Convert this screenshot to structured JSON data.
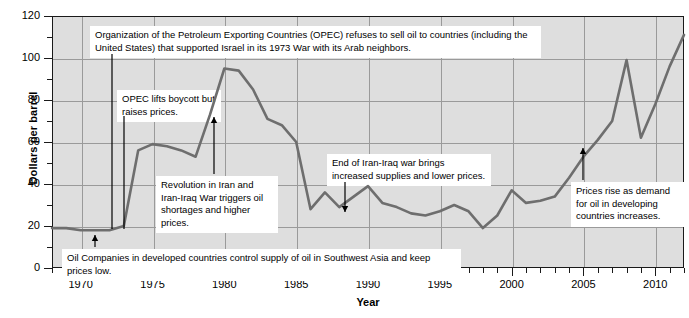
{
  "chart_data": {
    "type": "line",
    "title": "",
    "xlabel": "Year",
    "ylabel": "Dollars per barrel",
    "xlim": [
      1968,
      2012
    ],
    "ylim": [
      0,
      120
    ],
    "ytick_values": [
      0,
      20,
      40,
      60,
      80,
      100,
      120
    ],
    "ytick_labels": [
      "0",
      "20",
      "40",
      "60",
      "80",
      "100",
      "120"
    ],
    "xtick_values": [
      1970,
      1975,
      1980,
      1985,
      1990,
      1995,
      2000,
      2005,
      2010
    ],
    "xtick_labels": [
      "1970",
      "1975",
      "1980",
      "1985",
      "1990",
      "1995",
      "2000",
      "2005",
      "2010"
    ],
    "y_minor_step": 10,
    "x_minor_step": 1,
    "grid": true,
    "legend": "none",
    "series_name": "Crude oil price",
    "line_color": "#6e6e6e",
    "plot_background": "#dedede",
    "x": [
      1968,
      1969,
      1970,
      1971,
      1972,
      1973,
      1974,
      1975,
      1976,
      1977,
      1978,
      1979,
      1980,
      1981,
      1982,
      1983,
      1984,
      1985,
      1986,
      1987,
      1988,
      1989,
      1990,
      1991,
      1992,
      1993,
      1994,
      1995,
      1996,
      1997,
      1998,
      1999,
      2000,
      2001,
      2002,
      2003,
      2004,
      2005,
      2006,
      2007,
      2008,
      2009,
      2010,
      2011,
      2012
    ],
    "values": [
      19,
      19,
      18,
      18,
      18,
      20,
      56,
      59,
      58,
      56,
      53,
      73,
      95,
      94,
      85,
      71,
      68,
      60,
      28,
      36,
      29,
      34,
      39,
      31,
      29,
      26,
      25,
      27,
      30,
      27,
      19,
      25,
      37,
      31,
      32,
      34,
      43,
      53,
      61,
      70,
      99,
      62,
      78,
      96,
      111
    ],
    "annotations": [
      {
        "id": "opec-embargo",
        "text": "Organization of the Petroleum Exporting Countries (OPEC) refuses to sell oil to countries (including the United States) that supported Israel in its 1973 War with its Arab neighbors.",
        "arrow_year": 1972.6,
        "arrow_value": 22
      },
      {
        "id": "opec-lifts-boycott",
        "text": "OPEC lifts boycott but raises prices.",
        "arrow_year": 1972.6,
        "arrow_value": 22
      },
      {
        "id": "iran-revolution",
        "text": "Revolution in Iran and Iran-Iraq War triggers oil shortages and higher prices.",
        "arrow_year": 1979,
        "arrow_value": 72
      },
      {
        "id": "iran-iraq-war-end",
        "text": "End of Iran-Iraq war brings increased supplies and lower prices.",
        "arrow_year": 1988.5,
        "arrow_value": 30
      },
      {
        "id": "developing-demand",
        "text": "Prices rise as demand for oil in developing countries increases.",
        "arrow_year": 2005.4,
        "arrow_value": 55
      },
      {
        "id": "oil-companies-control",
        "text": "Oil Companies in developed countries control supply of oil in Southwest Asia and keep prices low.",
        "arrow_year": 1971.6,
        "arrow_value": 18
      }
    ]
  }
}
